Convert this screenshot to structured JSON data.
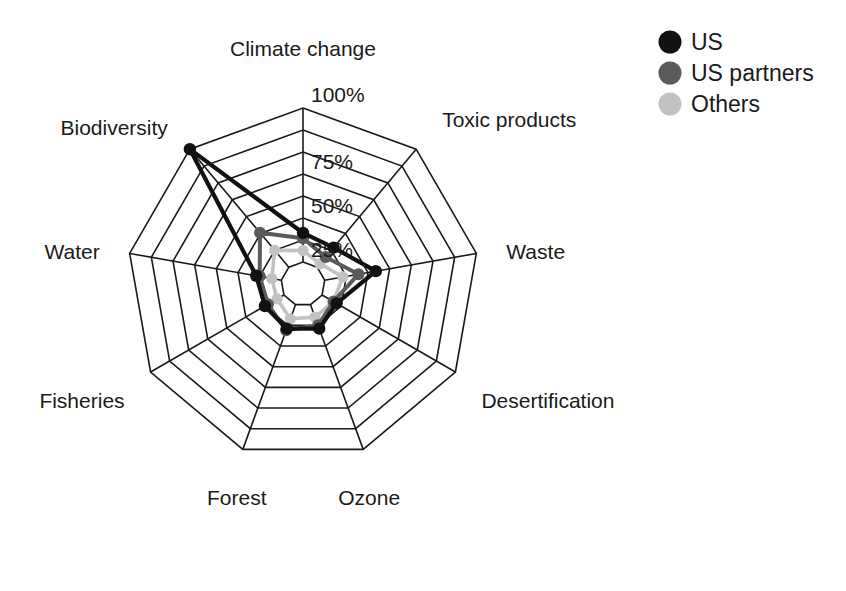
{
  "chart_data": {
    "type": "radar",
    "title": "",
    "categories": [
      "Climate change",
      "Toxic products",
      "Waste",
      "Desertification",
      "Ozone",
      "Forest",
      "Fisheries",
      "Water",
      "Biodiversity"
    ],
    "series": [
      {
        "name": "US",
        "color": "#111111",
        "values": [
          29,
          27,
          42,
          22,
          27,
          27,
          25,
          27,
          100
        ]
      },
      {
        "name": "US partners",
        "color": "#5a5a5a",
        "values": [
          26,
          20,
          32,
          20,
          25,
          28,
          23,
          25,
          38
        ]
      },
      {
        "name": "Others",
        "color": "#c2c2c2",
        "values": [
          19,
          15,
          23,
          20,
          20,
          21,
          17,
          18,
          25
        ]
      }
    ],
    "tick_labels": [
      "25%",
      "50%",
      "75%",
      "100%"
    ],
    "tick_values": [
      25,
      50,
      75,
      100
    ],
    "rlim": [
      0,
      100
    ],
    "grid": true,
    "grid_rings": [
      12.5,
      25,
      37.5,
      50,
      62.5,
      75,
      87.5,
      100
    ],
    "legend_position": "top-right",
    "xlabel": "",
    "ylabel": ""
  },
  "legend": {
    "items": [
      {
        "label": "US",
        "color": "#111111"
      },
      {
        "label": "US partners",
        "color": "#5a5a5a"
      },
      {
        "label": "Others",
        "color": "#c2c2c2"
      }
    ]
  }
}
